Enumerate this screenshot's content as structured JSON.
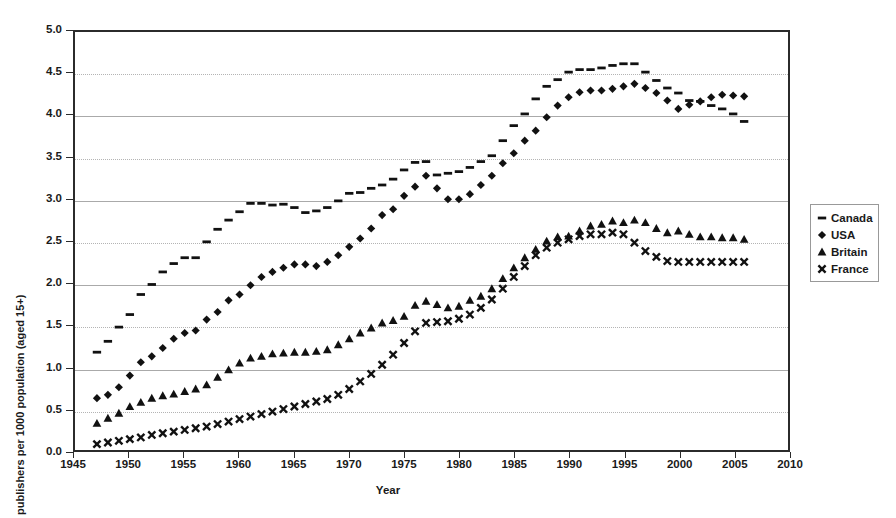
{
  "chart_data": {
    "type": "scatter",
    "title": "",
    "xlabel": "Year",
    "ylabel": "publishers per 1000 population (aged 15+)",
    "xlim": [
      1945,
      2010
    ],
    "ylim": [
      0.0,
      5.0
    ],
    "xticks": [
      1945,
      1950,
      1955,
      1960,
      1965,
      1970,
      1975,
      1980,
      1985,
      1990,
      1995,
      2000,
      2005,
      2010
    ],
    "yticks": [
      "0.0",
      "0.5",
      "1.0",
      "1.5",
      "2.0",
      "2.5",
      "3.0",
      "3.5",
      "4.0",
      "4.5",
      "5.0"
    ],
    "grid": true,
    "legend_position": "right",
    "x": [
      1947,
      1948,
      1949,
      1950,
      1951,
      1952,
      1953,
      1954,
      1955,
      1956,
      1957,
      1958,
      1959,
      1960,
      1961,
      1962,
      1963,
      1964,
      1965,
      1966,
      1967,
      1968,
      1969,
      1970,
      1971,
      1972,
      1973,
      1974,
      1975,
      1976,
      1977,
      1978,
      1979,
      1980,
      1981,
      1982,
      1983,
      1984,
      1985,
      1986,
      1987,
      1988,
      1989,
      1990,
      1991,
      1992,
      1993,
      1994,
      1995,
      1996,
      1997,
      1998,
      1999,
      2000,
      2001,
      2002,
      2003,
      2004,
      2005,
      2006
    ],
    "series": [
      {
        "name": "Canada",
        "marker": "dash",
        "values": [
          1.17,
          1.3,
          1.47,
          1.62,
          1.86,
          1.98,
          2.13,
          2.23,
          2.3,
          2.3,
          2.49,
          2.64,
          2.75,
          2.85,
          2.95,
          2.95,
          2.93,
          2.94,
          2.9,
          2.84,
          2.86,
          2.9,
          2.98,
          3.07,
          3.08,
          3.13,
          3.17,
          3.24,
          3.35,
          3.44,
          3.45,
          3.29,
          3.31,
          3.33,
          3.38,
          3.45,
          3.52,
          3.7,
          3.88,
          4.02,
          4.2,
          4.35,
          4.43,
          4.52,
          4.55,
          4.55,
          4.57,
          4.6,
          4.62,
          4.62,
          4.52,
          4.42,
          4.33,
          4.27,
          4.18,
          4.17,
          4.12,
          4.08,
          4.02,
          3.93
        ]
      },
      {
        "name": "USA",
        "marker": "diamond",
        "values": [
          0.62,
          0.66,
          0.75,
          0.89,
          1.05,
          1.12,
          1.22,
          1.33,
          1.4,
          1.43,
          1.56,
          1.65,
          1.79,
          1.86,
          1.97,
          2.07,
          2.13,
          2.18,
          2.22,
          2.22,
          2.2,
          2.25,
          2.33,
          2.43,
          2.53,
          2.65,
          2.81,
          2.88,
          3.04,
          3.15,
          3.28,
          3.13,
          3.0,
          3.0,
          3.06,
          3.17,
          3.28,
          3.43,
          3.55,
          3.7,
          3.82,
          3.98,
          4.12,
          4.22,
          4.28,
          4.3,
          4.3,
          4.32,
          4.35,
          4.38,
          4.33,
          4.27,
          4.18,
          4.08,
          4.13,
          4.17,
          4.22,
          4.25,
          4.24,
          4.23
        ]
      },
      {
        "name": "Britain",
        "marker": "triangle",
        "values": [
          0.32,
          0.38,
          0.44,
          0.52,
          0.57,
          0.62,
          0.65,
          0.67,
          0.7,
          0.73,
          0.78,
          0.87,
          0.96,
          1.04,
          1.1,
          1.12,
          1.15,
          1.16,
          1.17,
          1.17,
          1.18,
          1.2,
          1.26,
          1.33,
          1.4,
          1.46,
          1.52,
          1.55,
          1.6,
          1.73,
          1.78,
          1.74,
          1.7,
          1.72,
          1.79,
          1.84,
          1.93,
          2.05,
          2.18,
          2.3,
          2.4,
          2.5,
          2.55,
          2.56,
          2.62,
          2.68,
          2.7,
          2.74,
          2.72,
          2.75,
          2.72,
          2.65,
          2.6,
          2.62,
          2.58,
          2.55,
          2.55,
          2.54,
          2.54,
          2.52
        ]
      },
      {
        "name": "France",
        "marker": "x",
        "values": [
          0.07,
          0.09,
          0.11,
          0.13,
          0.15,
          0.18,
          0.2,
          0.22,
          0.24,
          0.26,
          0.28,
          0.31,
          0.34,
          0.37,
          0.4,
          0.43,
          0.46,
          0.49,
          0.52,
          0.55,
          0.58,
          0.61,
          0.66,
          0.73,
          0.82,
          0.91,
          1.02,
          1.14,
          1.28,
          1.42,
          1.52,
          1.53,
          1.54,
          1.57,
          1.62,
          1.7,
          1.8,
          1.93,
          2.07,
          2.2,
          2.33,
          2.42,
          2.48,
          2.52,
          2.56,
          2.58,
          2.58,
          2.6,
          2.58,
          2.48,
          2.38,
          2.31,
          2.26,
          2.25,
          2.25,
          2.25,
          2.25,
          2.25,
          2.25,
          2.25
        ]
      }
    ]
  },
  "legend": {
    "items": [
      {
        "label": "Canada",
        "key": "dash-marker"
      },
      {
        "label": "USA",
        "key": "diamond-marker"
      },
      {
        "label": "Britain",
        "key": "triangle-marker"
      },
      {
        "label": "France",
        "key": "x-marker"
      }
    ]
  }
}
